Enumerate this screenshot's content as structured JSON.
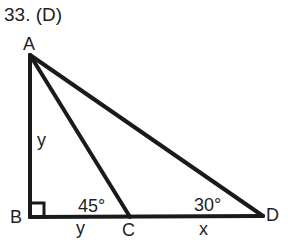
{
  "header": {
    "title": "33. (D)"
  },
  "diagram": {
    "vertices": {
      "A": {
        "label": "A",
        "x": 30,
        "y": 55
      },
      "B": {
        "label": "B",
        "x": 30,
        "y": 217
      },
      "C": {
        "label": "C",
        "x": 130,
        "y": 217
      },
      "D": {
        "label": "D",
        "x": 263,
        "y": 216
      }
    },
    "segments": [
      {
        "from": "A",
        "to": "B",
        "label": "y"
      },
      {
        "from": "B",
        "to": "C",
        "label": "y"
      },
      {
        "from": "C",
        "to": "D",
        "label": "x"
      },
      {
        "from": "A",
        "to": "C",
        "label": ""
      },
      {
        "from": "A",
        "to": "D",
        "label": ""
      }
    ],
    "angles": {
      "ACB": "45°",
      "ADB": "30°",
      "ABD": "right-angle"
    },
    "labels": {
      "A": "A",
      "B": "B",
      "C": "C",
      "D": "D",
      "AB": "y",
      "BC": "y",
      "CD": "x",
      "angle_C": "45°",
      "angle_D": "30°"
    },
    "stroke_color": "#1a1a1a"
  }
}
